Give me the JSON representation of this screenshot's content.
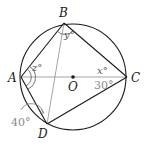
{
  "colors": {
    "stroke": "#1a1a1a",
    "guide": "#9a9a9a",
    "given_text": "#8a8a8a"
  },
  "points": {
    "A": {
      "label": "A",
      "x": 21,
      "y": 77
    },
    "B": {
      "label": "B",
      "x": 64,
      "y": 23
    },
    "C": {
      "label": "C",
      "x": 127,
      "y": 77
    },
    "D": {
      "label": "D",
      "x": 47,
      "y": 124
    },
    "O": {
      "label": "O",
      "x": 73,
      "y": 77
    }
  },
  "circle": {
    "cx": 73,
    "cy": 77,
    "r": 53
  },
  "angles": {
    "z": "z°",
    "y": "y°",
    "x": "x°",
    "given_c": "30°",
    "given_a": "40°"
  }
}
